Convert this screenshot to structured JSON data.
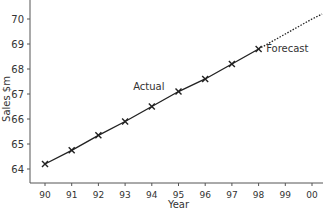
{
  "chart_data": {
    "type": "line",
    "title": "",
    "xlabel": "Year",
    "ylabel": "Sales $m",
    "x_ticks": [
      "90",
      "91",
      "92",
      "93",
      "94",
      "95",
      "96",
      "97",
      "98",
      "99",
      "00"
    ],
    "y_ticks": [
      64,
      65,
      66,
      67,
      68,
      69,
      70
    ],
    "ylim": [
      63.5,
      70.6
    ],
    "grid": false,
    "series": [
      {
        "name": "Actual",
        "style": "solid with x markers",
        "x": [
          "90",
          "91",
          "92",
          "93",
          "94",
          "95",
          "96",
          "97",
          "98"
        ],
        "values": [
          64.2,
          64.75,
          65.35,
          65.9,
          66.5,
          67.1,
          67.6,
          68.2,
          68.8
        ]
      },
      {
        "name": "Forecast",
        "style": "dotted",
        "x": [
          "98",
          "99",
          "00",
          "00+"
        ],
        "values": [
          68.8,
          69.4,
          70.0,
          70.2
        ]
      }
    ],
    "annotations": [
      {
        "text": "Actual",
        "near_x": "94",
        "near_y": 67.3
      },
      {
        "text": "Forecast",
        "near_x": "99",
        "near_y": 68.8
      }
    ],
    "line_color": "#222222"
  }
}
